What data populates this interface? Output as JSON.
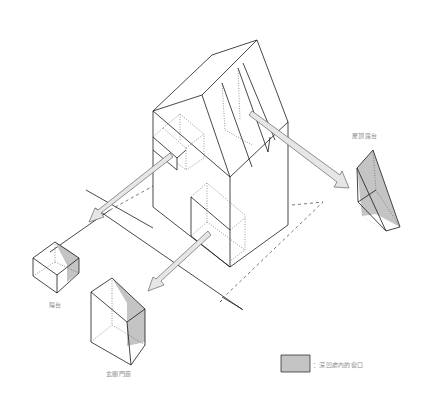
{
  "diagram": {
    "title": "",
    "labels": {
      "rooftop_terrace": "屋頂露台",
      "balcony": "陽台",
      "entrance_porch": "玄關門廊"
    },
    "legend": {
      "swatch_color": "#c4c4c4",
      "text": "：深凹處內的窗口"
    },
    "colors": {
      "line": "#1a1a1a",
      "dashed": "#555555",
      "shade": "#c4c4c4",
      "arrow_fill": "#e6e6e6",
      "arrow_stroke": "#666666",
      "label_text": "#8a8a8a"
    }
  }
}
